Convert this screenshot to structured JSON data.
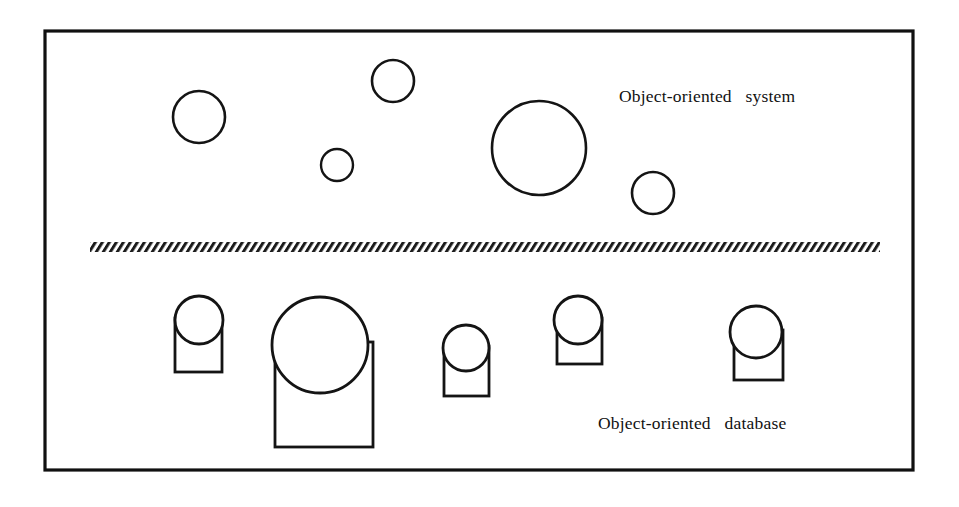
{
  "figure": {
    "width": 959,
    "height": 507,
    "background_color": "#ffffff",
    "ink_color": "#141414"
  },
  "frame": {
    "name": "outer-border",
    "x": 45,
    "y": 31,
    "width": 868,
    "height": 439,
    "stroke_color": "#101010",
    "stroke_width": 3.2
  },
  "labels": {
    "system": "Object-oriented   system",
    "database": "Object-oriented   database"
  },
  "divider": {
    "name": "hatched-separator",
    "x": 90,
    "y": 242,
    "width": 790,
    "height": 10,
    "pattern": "diagonal-hatch",
    "stripe_pitch": 7,
    "stripe_angle_deg": -55,
    "color": "#1a1a1a"
  },
  "upper_region": {
    "name": "object-oriented-system",
    "description": "Free-floating objects shown as plain circles",
    "circles": [
      {
        "id": "sys-obj-1",
        "cx": 199,
        "cy": 117,
        "r": 26
      },
      {
        "id": "sys-obj-2",
        "cx": 393,
        "cy": 81,
        "r": 21
      },
      {
        "id": "sys-obj-3",
        "cx": 337,
        "cy": 165,
        "r": 16
      },
      {
        "id": "sys-obj-4",
        "cx": 539,
        "cy": 148,
        "r": 47
      },
      {
        "id": "sys-obj-5",
        "cx": 653,
        "cy": 193,
        "r": 21
      }
    ]
  },
  "lower_region": {
    "name": "object-oriented-database",
    "description": "Persistent objects shown as circles seated on open storage rectangles",
    "items": [
      {
        "id": "db-obj-1",
        "circle": {
          "cx": 199,
          "cy": 320,
          "r": 24
        },
        "rect": {
          "x": 175,
          "y": 318,
          "width": 47,
          "height": 54
        }
      },
      {
        "id": "db-obj-2",
        "circle": {
          "cx": 320,
          "cy": 345,
          "r": 48
        },
        "rect": {
          "x": 275,
          "y": 342,
          "width": 98,
          "height": 105
        }
      },
      {
        "id": "db-obj-3",
        "circle": {
          "cx": 466,
          "cy": 348,
          "r": 23
        },
        "rect": {
          "x": 444,
          "y": 346,
          "width": 45,
          "height": 50
        }
      },
      {
        "id": "db-obj-4",
        "circle": {
          "cx": 578,
          "cy": 320,
          "r": 24
        },
        "rect": {
          "x": 557,
          "y": 318,
          "width": 45,
          "height": 46
        }
      },
      {
        "id": "db-obj-5",
        "circle": {
          "cx": 756,
          "cy": 332,
          "r": 26
        },
        "rect": {
          "x": 734,
          "y": 330,
          "width": 49,
          "height": 50
        }
      }
    ]
  }
}
